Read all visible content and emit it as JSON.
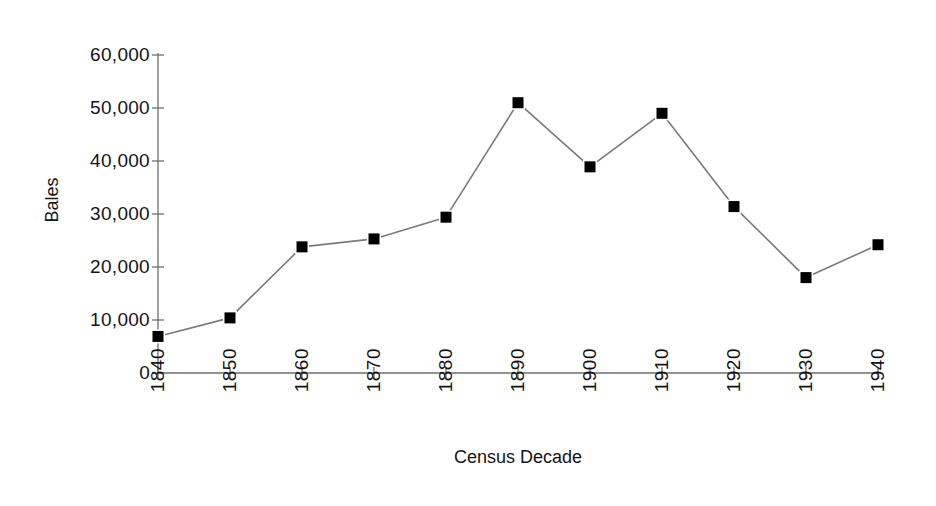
{
  "chart_data": {
    "type": "line",
    "title": "",
    "xlabel": "Census Decade",
    "ylabel": "Bales",
    "categories": [
      "1840",
      "1850",
      "1860",
      "1870",
      "1880",
      "1890",
      "1900",
      "1910",
      "1920",
      "1930",
      "1940"
    ],
    "values": [
      6900,
      10400,
      23800,
      25300,
      29400,
      51000,
      38900,
      49000,
      31400,
      18000,
      24200
    ],
    "series": [
      {
        "name": "Bales",
        "values": [
          6900,
          10400,
          23800,
          25300,
          29400,
          51000,
          38900,
          49000,
          31400,
          18000,
          24200
        ]
      }
    ],
    "ylim": [
      0,
      60000
    ],
    "y_ticks": [
      "0",
      "10,000",
      "20,000",
      "30,000",
      "40,000",
      "50,000",
      "60,000"
    ],
    "y_tick_values": [
      0,
      10000,
      20000,
      30000,
      40000,
      50000,
      60000
    ],
    "grid": false,
    "legend": false,
    "legend_position": "none",
    "marker": "square",
    "marker_color": "#000000",
    "line_color": "#7a7a7a",
    "background_color": "#ffffff",
    "axis_color": "#6e6e6e"
  }
}
